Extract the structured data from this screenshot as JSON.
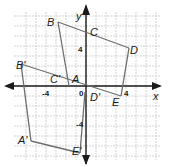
{
  "diagram": {
    "type": "coordinate-plane-transformation",
    "axes": {
      "x_label": "x",
      "y_label": "y",
      "origin_label": "0",
      "ticks": {
        "x_pos": "4",
        "x_neg": "-4",
        "y_pos": "4",
        "y_neg": "-4"
      },
      "range": {
        "x": [
          -8,
          7
        ],
        "y": [
          -7,
          8
        ]
      }
    },
    "figures": [
      {
        "name": "original",
        "vertices": [
          {
            "label": "A",
            "x": -1.5,
            "y": 0.5
          },
          {
            "label": "B",
            "x": -2.8,
            "y": 6.4
          },
          {
            "label": "C",
            "x": 0,
            "y": 5.4
          },
          {
            "label": "D",
            "x": 4.3,
            "y": 3.8
          },
          {
            "label": "E",
            "x": 3.5,
            "y": -1
          }
        ]
      },
      {
        "name": "image",
        "vertices": [
          {
            "label": "A'",
            "x": -5.5,
            "y": -5.5
          },
          {
            "label": "B'",
            "x": -6.5,
            "y": 2.2
          },
          {
            "label": "C'",
            "x": -3,
            "y": 0.5
          },
          {
            "label": "D'",
            "x": 0.2,
            "y": -0.6
          },
          {
            "label": "E'",
            "x": 0.5,
            "y": -6.7
          }
        ]
      }
    ],
    "colors": {
      "grid": "#c8c8c8",
      "axis": "#1a1a1a",
      "figure": "#6e6e6e"
    }
  }
}
